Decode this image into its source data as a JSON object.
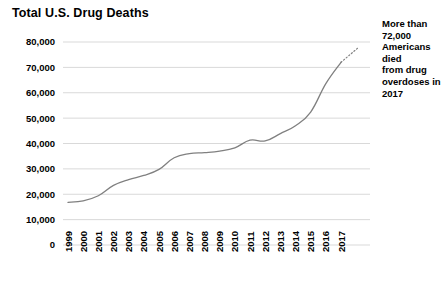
{
  "chart_data": {
    "type": "line",
    "title": "Total U.S. Drug Deaths",
    "xlabel": "",
    "ylabel": "",
    "x": [
      1999,
      2000,
      2001,
      2002,
      2003,
      2004,
      2005,
      2006,
      2007,
      2008,
      2009,
      2010,
      2011,
      2012,
      2013,
      2014,
      2015,
      2016,
      2017
    ],
    "categories": [
      "1999",
      "2000",
      "2001",
      "2002",
      "2003",
      "2004",
      "2005",
      "2006",
      "2007",
      "2008",
      "2009",
      "2010",
      "2011",
      "2012",
      "2013",
      "2014",
      "2015",
      "2016",
      "2017"
    ],
    "values": [
      16800,
      17400,
      19400,
      23500,
      25800,
      27400,
      29800,
      34400,
      36000,
      36400,
      37000,
      38300,
      41300,
      41000,
      43900,
      47000,
      52400,
      63600,
      72000
    ],
    "series": [
      {
        "name": "Total U.S. Drug Deaths",
        "values": [
          16800,
          17400,
          19400,
          23500,
          25800,
          27400,
          29800,
          34400,
          36000,
          36400,
          37000,
          38300,
          41300,
          41000,
          43900,
          47000,
          52400,
          63600,
          72000
        ]
      }
    ],
    "ylim": [
      0,
      80000
    ],
    "yticks": [
      0,
      10000,
      20000,
      30000,
      40000,
      50000,
      60000,
      70000,
      80000
    ],
    "ytick_labels": [
      "0",
      "10,000",
      "20,000",
      "30,000",
      "40,000",
      "50,000",
      "60,000",
      "70,000",
      "80,000"
    ],
    "grid": true,
    "legend": "none",
    "line_color": "#808080",
    "grid_color": "#d9d9d9",
    "annotations": [
      {
        "text": "More than 72,000 Americans died from drug overdoses in 2017",
        "lines": [
          "More than",
          "72,000",
          "Americans died",
          "from drug",
          "overdoses in",
          "2017"
        ],
        "target_x": 2017,
        "target_y": 72000,
        "leader": "dotted"
      }
    ]
  },
  "annotation_text": "More than 72,000 Americans died from drug overdoses in 2017"
}
